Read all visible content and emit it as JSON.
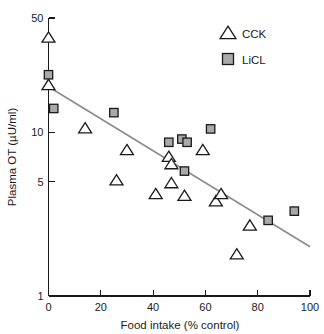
{
  "chart_data": {
    "type": "scatter",
    "title": "",
    "xlabel": "Food intake (% control)",
    "ylabel": "Plasma OT (µU/ml)",
    "xlim": [
      0,
      100
    ],
    "ylim": [
      1,
      50
    ],
    "yscale": "log",
    "xscale": "linear",
    "grid": false,
    "xticks": [
      "0",
      "20",
      "40",
      "60",
      "80",
      "100"
    ],
    "xtick_values": [
      0,
      20,
      40,
      60,
      80,
      100
    ],
    "yticks": [
      "1",
      "5",
      "10",
      "50"
    ],
    "ytick_values": [
      1,
      5,
      10,
      50
    ],
    "legend_position": "top-right",
    "series": [
      {
        "name": "CCK",
        "marker": "open-triangle",
        "color": "#ffffff",
        "edge_color": "#1a1a1a",
        "points": [
          {
            "x": 0,
            "y": 38.0
          },
          {
            "x": 0,
            "y": 19.5
          },
          {
            "x": 14,
            "y": 10.6
          },
          {
            "x": 26,
            "y": 5.1
          },
          {
            "x": 30,
            "y": 7.8
          },
          {
            "x": 41,
            "y": 4.2
          },
          {
            "x": 46,
            "y": 7.1
          },
          {
            "x": 47,
            "y": 6.4
          },
          {
            "x": 47,
            "y": 4.9
          },
          {
            "x": 52,
            "y": 4.1
          },
          {
            "x": 59,
            "y": 7.8
          },
          {
            "x": 64,
            "y": 3.8
          },
          {
            "x": 66,
            "y": 4.2
          },
          {
            "x": 72,
            "y": 1.8
          },
          {
            "x": 77,
            "y": 2.7
          }
        ]
      },
      {
        "name": "LiCL",
        "marker": "filled-square",
        "color": "#a9a9a9",
        "edge_color": "#1a1a1a",
        "points": [
          {
            "x": 0,
            "y": 22.5
          },
          {
            "x": 2,
            "y": 14.0
          },
          {
            "x": 25,
            "y": 13.2
          },
          {
            "x": 46,
            "y": 8.7
          },
          {
            "x": 51,
            "y": 9.1
          },
          {
            "x": 53,
            "y": 8.7
          },
          {
            "x": 52,
            "y": 5.8
          },
          {
            "x": 62,
            "y": 10.5
          },
          {
            "x": 84,
            "y": 2.9
          },
          {
            "x": 94,
            "y": 3.3
          }
        ]
      }
    ],
    "fit_line": {
      "name": "regression-line",
      "color": "#8a8a8a",
      "start": {
        "x": 0,
        "y": 19.0
      },
      "end": {
        "x": 100,
        "y": 2.0
      }
    }
  },
  "legend": {
    "items": [
      {
        "label": "CCK",
        "marker": "open-triangle"
      },
      {
        "label": "LiCL",
        "marker": "filled-square"
      }
    ]
  }
}
